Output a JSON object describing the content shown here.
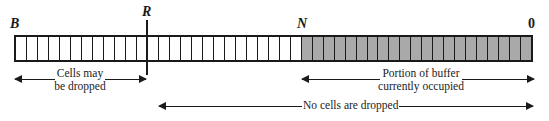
{
  "markers": {
    "b": "B",
    "r": "R",
    "n": "N",
    "zero": "0"
  },
  "buffer": {
    "total_cells": 47,
    "occupied_from_cell": 26,
    "colors": {
      "empty": "#ffffff",
      "occupied": "#a9a9a9",
      "stroke": "#1a1a1a"
    }
  },
  "annotations": {
    "drop_region": {
      "line1": "Cells may",
      "line2": "be dropped"
    },
    "occupied_region": {
      "line1": "Portion of buffer",
      "line2": "currently occupied"
    },
    "no_drop_region": {
      "label": "No cells are dropped"
    }
  }
}
